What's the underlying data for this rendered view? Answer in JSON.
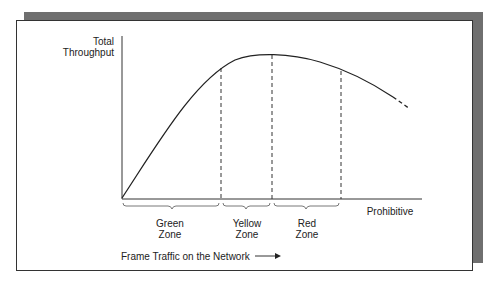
{
  "diagram": {
    "y_axis_label_line1": "Total",
    "y_axis_label_line2": "Throughput",
    "x_axis_label": "Frame Traffic on the Network",
    "zones": [
      {
        "line1": "Green",
        "line2": "Zone"
      },
      {
        "line1": "Yellow",
        "line2": "Zone"
      },
      {
        "line1": "Red",
        "line2": "Zone"
      }
    ],
    "prohibitive_label": "Prohibitive"
  }
}
